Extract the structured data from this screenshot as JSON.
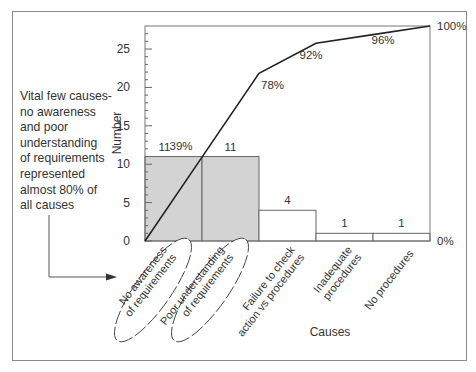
{
  "annotation": {
    "lines": [
      "Vital few causes-",
      "no awareness",
      "and poor",
      "understanding",
      "of requirements",
      "represented",
      "almost 80% of",
      "all causes"
    ]
  },
  "chart_data": {
    "type": "bar",
    "subtype": "pareto",
    "title": "",
    "xlabel": "Causes",
    "ylabel": "Number",
    "ylim": [
      0,
      28
    ],
    "yticks": [
      0,
      5,
      10,
      15,
      20,
      25
    ],
    "grid": false,
    "categories": [
      [
        "No awareness",
        "of requirements"
      ],
      [
        "Poor understanding",
        "of requirements"
      ],
      [
        "Failure to check",
        "action vs procedures"
      ],
      [
        "Inadequate",
        "procedures"
      ],
      [
        "No procedures"
      ]
    ],
    "series": [
      {
        "name": "Number",
        "type": "bar",
        "values": [
          11,
          11,
          4,
          1,
          1
        ],
        "labels": [
          "11",
          "11",
          "4",
          "1",
          "1"
        ],
        "highlight": [
          true,
          true,
          false,
          false,
          false
        ]
      },
      {
        "name": "Cumulative %",
        "type": "line",
        "values": [
          39,
          78,
          92,
          96,
          100
        ],
        "labels": [
          "39%",
          "78%",
          "92%",
          "96%",
          "100%"
        ]
      }
    ],
    "secondary_axis": {
      "labels": [
        "0%",
        "100%"
      ]
    },
    "colors": {
      "highlight_bar": "#d3d3d3",
      "bar": "#ffffff",
      "line": "#222222",
      "axis": "#777777"
    }
  }
}
